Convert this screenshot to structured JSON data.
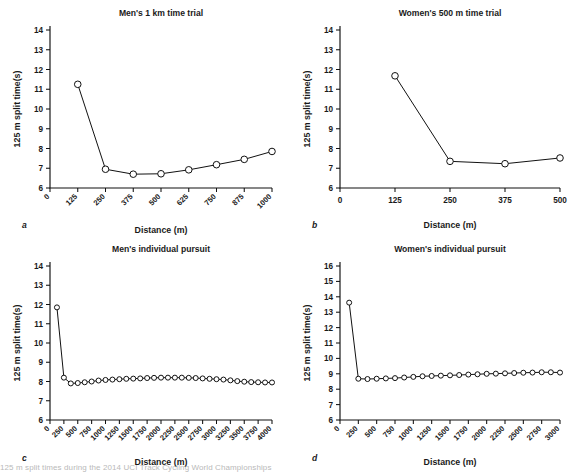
{
  "figure": {
    "ylabel": "125 m split time(s)",
    "xlabel": "Distance (m)",
    "caption": "125 m split times during the 2014 UCI Track Cycling World Championships"
  },
  "panels": [
    {
      "letter": "a",
      "title": "Men's 1 km time trial",
      "chart_data": {
        "type": "line",
        "title": "Men's 1 km time trial",
        "xlabel": "Distance (m)",
        "ylabel": "125 m split time(s)",
        "xlim": [
          0,
          1000
        ],
        "ylim": [
          6,
          14
        ],
        "xticks": [
          0,
          125,
          250,
          375,
          500,
          625,
          750,
          875,
          1000
        ],
        "yticks": [
          6,
          7,
          8,
          9,
          10,
          11,
          12,
          13,
          14
        ],
        "grid": false,
        "legend": "none",
        "marker": "open-circle",
        "x": [
          125,
          250,
          375,
          500,
          625,
          750,
          875,
          1000
        ],
        "values": [
          11.25,
          6.95,
          6.7,
          6.72,
          6.92,
          7.18,
          7.45,
          7.85
        ]
      }
    },
    {
      "letter": "b",
      "title": "Women's 500 m time trial",
      "chart_data": {
        "type": "line",
        "title": "Women's 500 m time trial",
        "xlabel": "Distance (m)",
        "ylabel": "125 m split time(s)",
        "xlim": [
          0,
          500
        ],
        "ylim": [
          6,
          14
        ],
        "xticks": [
          0,
          125,
          250,
          375,
          500
        ],
        "yticks": [
          6,
          7,
          8,
          9,
          10,
          11,
          12,
          13,
          14
        ],
        "grid": false,
        "legend": "none",
        "marker": "open-circle",
        "x": [
          125,
          250,
          375,
          500
        ],
        "values": [
          11.68,
          7.35,
          7.23,
          7.52
        ]
      }
    },
    {
      "letter": "c",
      "title": "Men's individual pursuit",
      "chart_data": {
        "type": "line",
        "title": "Men's individual pursuit",
        "xlabel": "Distance (m)",
        "ylabel": "125 m split time(s)",
        "xlim": [
          0,
          4000
        ],
        "ylim": [
          6,
          14
        ],
        "xticks": [
          0,
          250,
          500,
          750,
          1000,
          1250,
          1500,
          1750,
          2000,
          2250,
          2500,
          2750,
          3000,
          3250,
          3500,
          3750,
          4000
        ],
        "yticks": [
          6,
          7,
          8,
          9,
          10,
          11,
          12,
          13,
          14
        ],
        "grid": false,
        "legend": "none",
        "marker": "open-circle",
        "x": [
          125,
          250,
          375,
          500,
          625,
          750,
          875,
          1000,
          1125,
          1250,
          1375,
          1500,
          1625,
          1750,
          1875,
          2000,
          2125,
          2250,
          2375,
          2500,
          2625,
          2750,
          2875,
          3000,
          3125,
          3250,
          3375,
          3500,
          3625,
          3750,
          3875,
          4000
        ],
        "values": [
          11.85,
          8.2,
          7.9,
          7.92,
          7.96,
          8.0,
          8.05,
          8.08,
          8.1,
          8.12,
          8.14,
          8.15,
          8.16,
          8.18,
          8.19,
          8.2,
          8.2,
          8.2,
          8.2,
          8.19,
          8.18,
          8.16,
          8.14,
          8.12,
          8.1,
          8.06,
          8.02,
          7.99,
          7.97,
          7.96,
          7.95,
          7.95
        ]
      }
    },
    {
      "letter": "d",
      "title": "Women's individual pursuit",
      "chart_data": {
        "type": "line",
        "title": "Women's individual pursuit",
        "xlabel": "Distance (m)",
        "ylabel": "125 m split time(s)",
        "xlim": [
          0,
          3000
        ],
        "ylim": [
          6,
          16
        ],
        "xticks": [
          0,
          250,
          500,
          750,
          1000,
          1250,
          1500,
          1750,
          2000,
          2250,
          2500,
          2750,
          3000
        ],
        "yticks": [
          6,
          7,
          8,
          9,
          10,
          11,
          12,
          13,
          14,
          15,
          16
        ],
        "grid": false,
        "legend": "none",
        "marker": "open-circle",
        "x": [
          125,
          250,
          375,
          500,
          625,
          750,
          875,
          1000,
          1125,
          1250,
          1375,
          1500,
          1625,
          1750,
          1875,
          2000,
          2125,
          2250,
          2375,
          2500,
          2625,
          2750,
          2875,
          3000
        ],
        "values": [
          13.62,
          8.68,
          8.66,
          8.68,
          8.7,
          8.72,
          8.76,
          8.8,
          8.84,
          8.86,
          8.88,
          8.9,
          8.92,
          8.95,
          8.97,
          9.0,
          9.01,
          9.03,
          9.05,
          9.07,
          9.08,
          9.1,
          9.1,
          9.08
        ]
      }
    }
  ]
}
